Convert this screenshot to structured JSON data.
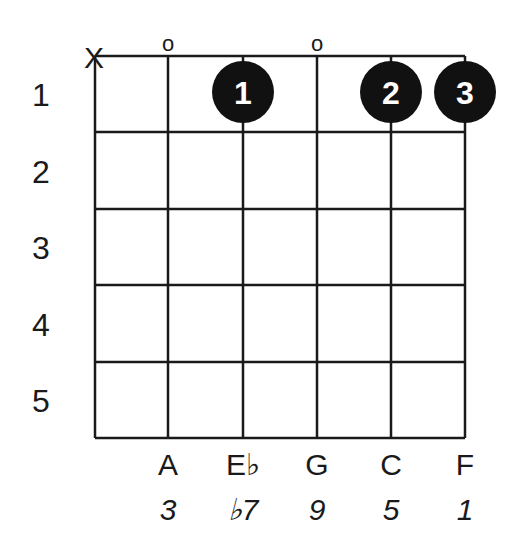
{
  "chord_diagram": {
    "strings": 6,
    "frets": 5,
    "fret_numbers": [
      "1",
      "2",
      "3",
      "4",
      "5"
    ],
    "string_markers": [
      {
        "string": 1,
        "marker": "X"
      },
      {
        "string": 2,
        "marker": "o"
      },
      {
        "string": 3,
        "marker": ""
      },
      {
        "string": 4,
        "marker": "o"
      },
      {
        "string": 5,
        "marker": ""
      },
      {
        "string": 6,
        "marker": ""
      }
    ],
    "fingers": [
      {
        "string": 3,
        "fret": 1,
        "label": "1"
      },
      {
        "string": 5,
        "fret": 1,
        "label": "2"
      },
      {
        "string": 6,
        "fret": 1,
        "label": "3"
      }
    ],
    "notes": [
      {
        "string": 2,
        "note": "A",
        "degree": "3"
      },
      {
        "string": 3,
        "note": "E♭",
        "degree": "♭7"
      },
      {
        "string": 4,
        "note": "G",
        "degree": "9"
      },
      {
        "string": 5,
        "note": "C",
        "degree": "5"
      },
      {
        "string": 6,
        "note": "F",
        "degree": "1"
      }
    ],
    "colors": {
      "line": "#1a1a1a",
      "dot": "#111111",
      "dot_text": "#ffffff"
    }
  }
}
